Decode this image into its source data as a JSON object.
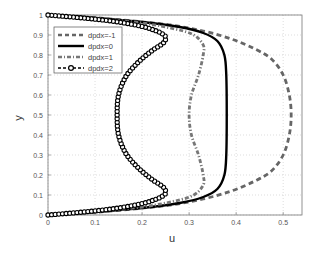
{
  "chart_data": {
    "type": "line",
    "title": "",
    "xlabel": "u",
    "ylabel": "y",
    "xlim": [
      0,
      0.54
    ],
    "ylim": [
      0,
      1
    ],
    "xticks": [
      0,
      0.1,
      0.2,
      0.3,
      0.4,
      0.5
    ],
    "xtick_labels": [
      "0",
      "0.1",
      "0.2",
      "0.3",
      "0.4",
      "0.5"
    ],
    "yticks": [
      0,
      0.1,
      0.2,
      0.3,
      0.4,
      0.5,
      0.6,
      0.7,
      0.8,
      0.9,
      1
    ],
    "ytick_labels": [
      "0",
      "0.1",
      "0.2",
      "0.3",
      "0.4",
      "0.5",
      "0.6",
      "0.7",
      "0.8",
      "0.9",
      "1"
    ],
    "grid": true,
    "legend_position": "upper left",
    "series": [
      {
        "name": "dpdx=-1",
        "style": "dashed",
        "color": "#666666",
        "points": [
          [
            0,
            0
          ],
          [
            0.08,
            0.01
          ],
          [
            0.18,
            0.03
          ],
          [
            0.26,
            0.05
          ],
          [
            0.33,
            0.08
          ],
          [
            0.39,
            0.12
          ],
          [
            0.44,
            0.17
          ],
          [
            0.475,
            0.22
          ],
          [
            0.5,
            0.3
          ],
          [
            0.513,
            0.4
          ],
          [
            0.517,
            0.5
          ],
          [
            0.513,
            0.6
          ],
          [
            0.5,
            0.7
          ],
          [
            0.475,
            0.78
          ],
          [
            0.44,
            0.83
          ],
          [
            0.39,
            0.88
          ],
          [
            0.33,
            0.92
          ],
          [
            0.26,
            0.95
          ],
          [
            0.18,
            0.97
          ],
          [
            0.08,
            0.99
          ],
          [
            0,
            1
          ]
        ]
      },
      {
        "name": "dpdx=0",
        "style": "solid",
        "color": "#000000",
        "points": [
          [
            0,
            0
          ],
          [
            0.1,
            0.015
          ],
          [
            0.2,
            0.035
          ],
          [
            0.28,
            0.06
          ],
          [
            0.33,
            0.09
          ],
          [
            0.36,
            0.13
          ],
          [
            0.375,
            0.2
          ],
          [
            0.379,
            0.3
          ],
          [
            0.38,
            0.5
          ],
          [
            0.379,
            0.7
          ],
          [
            0.375,
            0.8
          ],
          [
            0.36,
            0.87
          ],
          [
            0.33,
            0.91
          ],
          [
            0.28,
            0.94
          ],
          [
            0.2,
            0.965
          ],
          [
            0.1,
            0.985
          ],
          [
            0,
            1
          ]
        ]
      },
      {
        "name": "dpdx=1",
        "style": "dash-dot",
        "color": "#777777",
        "points": [
          [
            0,
            0
          ],
          [
            0.1,
            0.015
          ],
          [
            0.2,
            0.04
          ],
          [
            0.27,
            0.07
          ],
          [
            0.31,
            0.1
          ],
          [
            0.33,
            0.15
          ],
          [
            0.33,
            0.2
          ],
          [
            0.32,
            0.3
          ],
          [
            0.305,
            0.4
          ],
          [
            0.3,
            0.5
          ],
          [
            0.305,
            0.6
          ],
          [
            0.32,
            0.7
          ],
          [
            0.33,
            0.8
          ],
          [
            0.33,
            0.85
          ],
          [
            0.31,
            0.9
          ],
          [
            0.27,
            0.93
          ],
          [
            0.2,
            0.96
          ],
          [
            0.1,
            0.985
          ],
          [
            0,
            1
          ]
        ]
      },
      {
        "name": "dpdx=2",
        "style": "solid-circle-markers",
        "color": "#000000",
        "points": [
          [
            0,
            0
          ],
          [
            0.075,
            0.015
          ],
          [
            0.135,
            0.03
          ],
          [
            0.175,
            0.045
          ],
          [
            0.205,
            0.06
          ],
          [
            0.225,
            0.075
          ],
          [
            0.24,
            0.09
          ],
          [
            0.25,
            0.11
          ],
          [
            0.245,
            0.14
          ],
          [
            0.22,
            0.18
          ],
          [
            0.19,
            0.24
          ],
          [
            0.165,
            0.31
          ],
          [
            0.15,
            0.4
          ],
          [
            0.147,
            0.5
          ],
          [
            0.15,
            0.6
          ],
          [
            0.165,
            0.69
          ],
          [
            0.19,
            0.76
          ],
          [
            0.22,
            0.82
          ],
          [
            0.245,
            0.86
          ],
          [
            0.25,
            0.89
          ],
          [
            0.24,
            0.91
          ],
          [
            0.225,
            0.925
          ],
          [
            0.205,
            0.94
          ],
          [
            0.175,
            0.955
          ],
          [
            0.135,
            0.97
          ],
          [
            0.075,
            0.985
          ],
          [
            0,
            1
          ]
        ]
      }
    ]
  },
  "legend": {
    "items": [
      "dpdx=-1",
      "dpdx=0",
      "dpdx=1",
      "dpdx=2"
    ]
  }
}
